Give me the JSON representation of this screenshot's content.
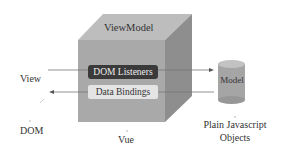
{
  "diagram": {
    "viewmodel": {
      "title": "ViewModel",
      "dom_listeners_label": "DOM Listeners",
      "data_bindings_label": "Data Bindings",
      "caption": "Vue"
    },
    "view": {
      "label": "View",
      "caption": "DOM"
    },
    "model": {
      "label": "Model",
      "caption_line1": "Plain Javascript",
      "caption_line2": "Objects"
    },
    "arrows": [
      {
        "from": "View",
        "to": "Model",
        "via": "DOM Listeners"
      },
      {
        "from": "Model",
        "to": "View",
        "via": "Data Bindings"
      }
    ],
    "colors": {
      "cube_front": "#a9a9a9",
      "cube_top": "#bdbdbd",
      "cube_side": "#8c8c8c",
      "dom_listeners_bg": "#3a3a3a",
      "data_bindings_bg": "#e4e4e4",
      "cylinder": "#a5a5a5"
    }
  }
}
